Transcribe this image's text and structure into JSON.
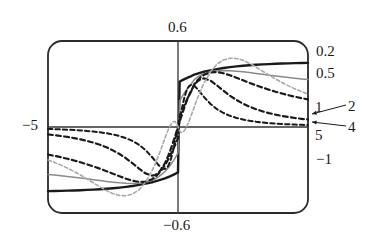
{
  "figure": {
    "title": "",
    "frame": {
      "shape": "rounded-rectangle",
      "x": 48,
      "y": 41,
      "width": 260,
      "height": 172,
      "radius": 14
    },
    "axes": {
      "origin": {
        "x": 181,
        "y": 127
      },
      "x_axis_label_left": "−5",
      "x_axis_label_right": "5",
      "y_axis_label_top": "0.6",
      "y_axis_label_bottom": "−0.6",
      "y_axis_label_neg_one": "−1"
    },
    "annotations": {
      "curve_0p2": "0.2",
      "curve_0p5": "0.5",
      "curve_1": "1",
      "curve_2": "2",
      "curve_4": "4",
      "curve_5": "5"
    },
    "colors": {
      "frame": "#2b2b2b",
      "axis": "#333333",
      "dark_curve": "#1a1a1a",
      "gray_curve": "#8a8a8a",
      "light_gray_curve": "#a8a8a8",
      "text": "#1a1a1a"
    }
  },
  "chart_data": {
    "type": "line",
    "title": "",
    "xlabel": "",
    "ylabel": "",
    "xlim": [
      -5,
      5
    ],
    "ylim": [
      -0.6,
      0.6
    ],
    "xticks": [
      -5,
      0,
      5
    ],
    "xticklabels": [
      "−5",
      "",
      "5"
    ],
    "yticks": [
      -0.6,
      0,
      0.6
    ],
    "yticklabels": [
      "−0.6",
      "",
      "0.6"
    ],
    "grid": false,
    "legend": "inline-right-edge",
    "x": [
      -5,
      -4.75,
      -4.5,
      -4.25,
      -4,
      -3.75,
      -3.5,
      -3.25,
      -3,
      -2.75,
      -2.5,
      -2.25,
      -2,
      -1.75,
      -1.5,
      -1.25,
      -1,
      -0.875,
      -0.75,
      -0.625,
      -0.5,
      -0.4375,
      -0.375,
      -0.3125,
      -0.25,
      -0.1875,
      -0.125,
      -0.0625,
      0,
      0.0625,
      0.125,
      0.1875,
      0.25,
      0.3125,
      0.375,
      0.4375,
      0.5,
      0.625,
      0.75,
      0.875,
      1,
      1.25,
      1.5,
      1.75,
      2,
      2.25,
      2.5,
      2.75,
      3,
      3.25,
      3.5,
      3.75,
      4,
      4.25,
      4.5,
      4.75,
      5
    ],
    "series": [
      {
        "name": "0.2",
        "label": "0.2",
        "style": "solid",
        "color": "#1a1a1a",
        "width": 2.4,
        "values": [
          -0.4472,
          -0.4464,
          -0.4454,
          -0.4441,
          -0.4427,
          -0.441,
          -0.439,
          -0.4367,
          -0.4339,
          -0.4307,
          -0.427,
          -0.4226,
          -0.4174,
          -0.4113,
          -0.4041,
          -0.3955,
          -0.3853,
          -0.3794,
          -0.373,
          -0.3659,
          -0.3581,
          -0.3538,
          -0.3494,
          -0.3447,
          -0.3397,
          -0.3344,
          -0.3288,
          -0.3229,
          -0.3167,
          0.3167,
          0.3229,
          0.3288,
          0.3344,
          0.3397,
          0.3447,
          0.3494,
          0.3538,
          0.3659,
          0.373,
          0.3794,
          0.3853,
          0.3955,
          0.4041,
          0.4113,
          0.4174,
          0.4226,
          0.427,
          0.4307,
          0.4339,
          0.4367,
          0.439,
          0.441,
          0.4427,
          0.4441,
          0.4454,
          0.4464,
          0.4472
        ]
      },
      {
        "name": "0.5",
        "label": "0.5",
        "style": "solid",
        "color": "#8a8a8a",
        "width": 1.5,
        "values": [
          -0.331,
          -0.3354,
          -0.3401,
          -0.3451,
          -0.3504,
          -0.356,
          -0.3618,
          -0.3678,
          -0.3738,
          -0.3797,
          -0.3851,
          -0.3897,
          -0.393,
          -0.3942,
          -0.3922,
          -0.3855,
          -0.3714,
          -0.361,
          -0.3476,
          -0.3308,
          -0.31,
          -0.298,
          -0.2848,
          -0.2704,
          -0.2548,
          -0.238,
          -0.22,
          -0.2008,
          -0.1804,
          0.1804,
          0.2008,
          0.22,
          0.238,
          0.2548,
          0.2704,
          0.2848,
          0.298,
          0.3308,
          0.3476,
          0.361,
          0.3714,
          0.3855,
          0.3922,
          0.3942,
          0.393,
          0.3897,
          0.3851,
          0.3797,
          0.3738,
          0.3678,
          0.3618,
          0.356,
          0.3504,
          0.3451,
          0.3401,
          0.3354,
          0.331
        ]
      },
      {
        "name": "1",
        "label": "1",
        "style": "dashed",
        "color": "#1a1a1a",
        "width": 2.2,
        "values": [
          -0.1923,
          -0.2013,
          -0.2111,
          -0.2218,
          -0.2335,
          -0.2462,
          -0.26,
          -0.275,
          -0.291,
          -0.3081,
          -0.3258,
          -0.3437,
          -0.3606,
          -0.3747,
          -0.383,
          -0.3812,
          -0.3642,
          -0.3479,
          -0.3261,
          -0.2984,
          -0.2646,
          -0.2455,
          -0.225,
          -0.2031,
          -0.18,
          -0.1557,
          -0.1304,
          -0.1043,
          -0.0774,
          0.0774,
          0.1043,
          0.1304,
          0.1557,
          0.18,
          0.2031,
          0.225,
          0.2455,
          0.2984,
          0.3261,
          0.3479,
          0.3642,
          0.3812,
          0.383,
          0.3747,
          0.3606,
          0.3437,
          0.3258,
          0.3081,
          0.291,
          0.275,
          0.26,
          0.2462,
          0.2335,
          0.2218,
          0.2111,
          0.2013,
          0.1923
        ]
      },
      {
        "name": "2",
        "label": "2",
        "style": "dashed",
        "color": "#1a1a1a",
        "width": 2.2,
        "values": [
          -0.0519,
          -0.057,
          -0.0628,
          -0.0695,
          -0.0773,
          -0.0863,
          -0.0969,
          -0.1094,
          -0.1242,
          -0.1419,
          -0.1631,
          -0.1884,
          -0.2183,
          -0.2528,
          -0.29,
          -0.3238,
          -0.3392,
          -0.3347,
          -0.3192,
          -0.2916,
          -0.2516,
          -0.2272,
          -0.2002,
          -0.1708,
          -0.1393,
          -0.106,
          -0.0714,
          -0.0358,
          0.0,
          0.0358,
          0.0714,
          0.106,
          0.1393,
          0.1708,
          0.2002,
          0.2272,
          0.2516,
          0.2916,
          0.3192,
          0.3347,
          0.3392,
          0.3238,
          0.29,
          0.2528,
          0.2183,
          0.1884,
          0.1631,
          0.1419,
          0.1242,
          0.1094,
          0.0969,
          0.0863,
          0.0773,
          0.0695,
          0.0628,
          0.057,
          0.0519
        ]
      },
      {
        "name": "4",
        "label": "4",
        "style": "dashed",
        "color": "#1a1a1a",
        "width": 2.0,
        "values": [
          -0.0134,
          -0.0149,
          -0.0167,
          -0.0187,
          -0.0211,
          -0.024,
          -0.0275,
          -0.0317,
          -0.037,
          -0.0437,
          -0.0522,
          -0.0633,
          -0.078,
          -0.0977,
          -0.1244,
          -0.1608,
          -0.2093,
          -0.2373,
          -0.2652,
          -0.2873,
          -0.293,
          -0.2865,
          -0.2715,
          -0.246,
          -0.209,
          -0.1615,
          -0.1068,
          -0.0504,
          0.0,
          0.0504,
          0.1068,
          0.1615,
          0.209,
          0.246,
          0.2715,
          0.2865,
          0.293,
          0.2873,
          0.2652,
          0.2373,
          0.2093,
          0.1608,
          0.1244,
          0.0977,
          0.078,
          0.0633,
          0.0522,
          0.0437,
          0.037,
          0.0317,
          0.0275,
          0.024,
          0.0211,
          0.0187,
          0.0167,
          0.0149,
          0.0134
        ]
      },
      {
        "name": "5",
        "label": "5",
        "style": "dashed",
        "color": "#a8a8a8",
        "width": 1.6,
        "values": [
          -0.23,
          -0.247,
          -0.266,
          -0.287,
          -0.31,
          -0.335,
          -0.362,
          -0.39,
          -0.418,
          -0.444,
          -0.465,
          -0.478,
          -0.48,
          -0.468,
          -0.438,
          -0.385,
          -0.306,
          -0.257,
          -0.201,
          -0.14,
          -0.077,
          -0.047,
          -0.019,
          0.005,
          0.024,
          0.036,
          0.039,
          0.028,
          0.0,
          -0.028,
          -0.039,
          -0.036,
          -0.024,
          -0.005,
          0.019,
          0.047,
          0.077,
          0.14,
          0.201,
          0.257,
          0.306,
          0.385,
          0.438,
          0.468,
          0.48,
          0.478,
          0.465,
          0.444,
          0.418,
          0.39,
          0.362,
          0.335,
          0.31,
          0.287,
          0.266,
          0.247,
          0.23
        ]
      }
    ]
  }
}
